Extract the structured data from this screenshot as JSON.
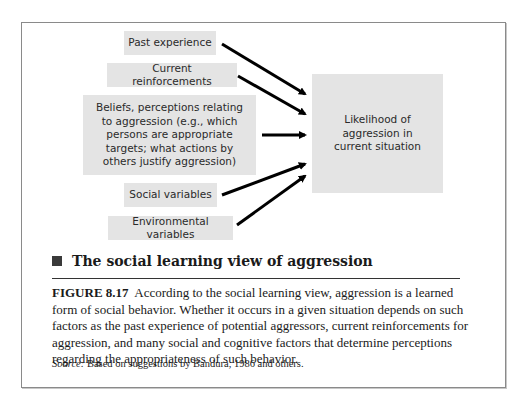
{
  "diagram": {
    "inputs": [
      {
        "id": "past-experience",
        "label": "Past experience"
      },
      {
        "id": "current-reinforcements",
        "label": "Current reinforcements"
      },
      {
        "id": "beliefs",
        "label": "Beliefs, perceptions relating to aggression (e.g., which persons are appropriate targets; what actions by others justify aggression)"
      },
      {
        "id": "social-variables",
        "label": "Social variables"
      },
      {
        "id": "environmental-variables",
        "label": "Environmental variables"
      }
    ],
    "output": {
      "id": "likelihood",
      "label": "Likelihood of aggression in current situation"
    },
    "edges": [
      {
        "from": "past-experience",
        "to": "likelihood"
      },
      {
        "from": "current-reinforcements",
        "to": "likelihood"
      },
      {
        "from": "beliefs",
        "to": "likelihood"
      },
      {
        "from": "social-variables",
        "to": "likelihood"
      },
      {
        "from": "environmental-variables",
        "to": "likelihood"
      }
    ],
    "box_color": "#e4e4e4",
    "arrow_color": "#000000"
  },
  "heading": "The social learning view of aggression",
  "caption": {
    "figure_label": "FIGURE 8.17",
    "text": "According to the social learning view, aggression is a learned form of social behavior. Whether it occurs in a given situation depends on such factors as the past experience of potential aggressors, current reinforcements for aggression, and many social and cognitive factors that determine perceptions regarding the appropriateness of such behavior."
  },
  "source": {
    "label": "Source:",
    "text": "Based on suggestions by Bandura, 1986 and others."
  }
}
